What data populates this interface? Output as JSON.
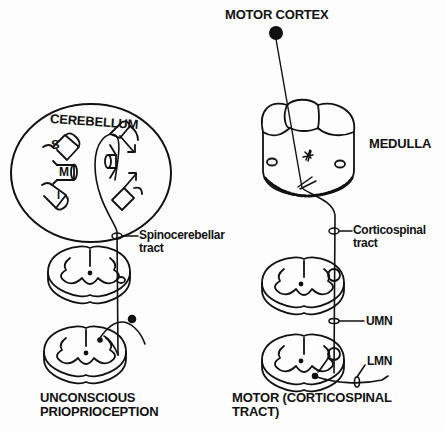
{
  "left_panel": {
    "cerebellum_label": "CEREBELLUM",
    "lobe_labels": {
      "superior": "S",
      "middle": "M",
      "inferior": "I"
    },
    "tract_label_line1": "Spinocerebellar",
    "tract_label_line2": "tract",
    "caption_line1": "UNCONSCIOUS",
    "caption_line2": "PRIOPRIOCEPTION"
  },
  "right_panel": {
    "cortex_label": "MOTOR CORTEX",
    "medulla_label": "MEDULLA",
    "tract_label_line1": "Corticospinal",
    "tract_label_line2": "tract",
    "umn_label": "UMN",
    "lmn_label": "LMN",
    "caption_line1": "MOTOR (CORTICOSPINAL",
    "caption_line2": "TRACT)"
  },
  "colors": {
    "ink": "#111111",
    "background": "#fdfdfd"
  }
}
